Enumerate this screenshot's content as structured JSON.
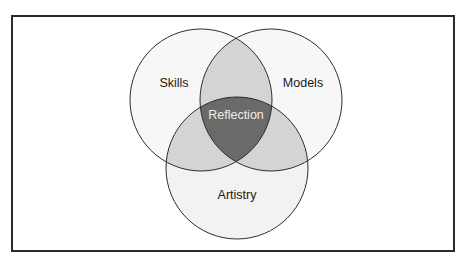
{
  "diagram": {
    "type": "venn",
    "sets": [
      {
        "id": "skills",
        "label": "Skills"
      },
      {
        "id": "models",
        "label": "Models"
      },
      {
        "id": "artistry",
        "label": "Artistry"
      }
    ],
    "center_label": "Reflection",
    "colors": {
      "single": "#f6f6f6",
      "pair": "#d3d3d3",
      "center": "#6a6a6a",
      "stroke": "#2e2e2e",
      "frame": "#2a2a2a"
    }
  }
}
